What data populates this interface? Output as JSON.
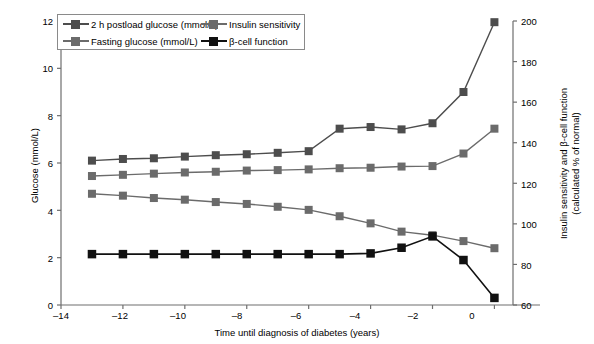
{
  "chart_data": {
    "type": "line",
    "title": "",
    "subtitle": "",
    "xlabel": "Time until diagnosis of diabetes (years)",
    "ylabel": "Glucose (mmol/L)",
    "ylabel_right_line1": "Insulin sensitivity and β-cell function",
    "ylabel_right_line2": "(calculated % of normal)",
    "grid": false,
    "legend_position": "top-left-inside",
    "xlim": [
      -14,
      0.6
    ],
    "xticks": [
      -14,
      -12,
      -10,
      -8,
      -6,
      -4,
      -2,
      0
    ],
    "xticklabels": [
      "–14",
      "–12",
      "–10",
      "–8",
      "–6",
      "–4",
      "–2",
      "0"
    ],
    "ylim": [
      0,
      12
    ],
    "yticks": [
      0,
      2,
      4,
      6,
      8,
      10,
      12
    ],
    "yticklabels": [
      "0",
      "2",
      "4",
      "6",
      "8",
      "10",
      "12"
    ],
    "ylim_right": [
      60,
      200
    ],
    "yticks_right": [
      60,
      80,
      100,
      120,
      140,
      160,
      180,
      200
    ],
    "yticklabels_right": [
      "60",
      "80",
      "100",
      "120",
      "140",
      "160",
      "180",
      "200"
    ],
    "x": [
      -13,
      -12,
      -11,
      -10,
      -9,
      -8,
      -7,
      -6,
      -5,
      -4,
      -3,
      -2,
      -1,
      0
    ],
    "series": [
      {
        "name": "2 h postload glucose (mmol/L)",
        "axis": "left",
        "color": "#4d4d4d",
        "marker": "square",
        "values": [
          6.1,
          6.17,
          6.2,
          6.27,
          6.33,
          6.37,
          6.43,
          6.5,
          7.45,
          7.52,
          7.42,
          7.68,
          9.0,
          11.95
        ]
      },
      {
        "name": "Fasting glucose (mmol/L)",
        "axis": "left",
        "color": "#6b6b6b",
        "marker": "square",
        "values": [
          5.45,
          5.5,
          5.55,
          5.6,
          5.63,
          5.68,
          5.7,
          5.73,
          5.78,
          5.8,
          5.85,
          5.87,
          6.4,
          7.45
        ]
      },
      {
        "name": "Insulin sensitivity",
        "axis": "left",
        "color": "#6b6b6b",
        "marker": "square",
        "values": [
          4.7,
          4.62,
          4.52,
          4.45,
          4.35,
          4.27,
          4.15,
          4.02,
          3.75,
          3.45,
          3.1,
          2.95,
          2.7,
          2.4
        ]
      },
      {
        "name": "β-cell function",
        "axis": "left",
        "color": "#111111",
        "marker": "square",
        "values": [
          2.15,
          2.15,
          2.15,
          2.15,
          2.15,
          2.15,
          2.15,
          2.15,
          2.15,
          2.18,
          2.42,
          2.9,
          1.9,
          0.3
        ]
      }
    ],
    "series_right_equivalents": [
      {
        "name": "Insulin sensitivity",
        "values_percent": [
          115,
          114,
          113,
          112,
          111,
          110,
          109,
          107,
          104,
          100,
          96,
          94,
          91,
          88
        ]
      },
      {
        "name": "β-cell function",
        "values_percent": [
          85,
          85,
          85,
          85,
          85,
          85,
          85,
          85,
          85,
          85,
          88,
          94,
          82,
          62
        ]
      }
    ],
    "annotations": []
  },
  "legend": {
    "entries": [
      {
        "label": "2 h postload glucose (mmol/L)",
        "color": "#4d4d4d"
      },
      {
        "label": "Insulin sensitivity",
        "color": "#6b6b6b"
      },
      {
        "label": "Fasting glucose (mmol/L)",
        "color": "#6b6b6b"
      },
      {
        "label": "β-cell function",
        "color": "#111111"
      }
    ]
  },
  "axes": {
    "left_title": "Glucose (mmol/L)",
    "right_title_line1": "Insulin sensitivity and β-cell function",
    "right_title_line2": "(calculated % of normal)",
    "bottom_title": "Time until diagnosis of diabetes (years)",
    "left_ticks": [
      "12",
      "10",
      "8",
      "6",
      "4",
      "2",
      "0"
    ],
    "right_ticks": [
      "200",
      "180",
      "160",
      "140",
      "120",
      "100",
      "80",
      "60"
    ],
    "bottom_ticks": [
      "–14",
      "–12",
      "–10",
      "–8",
      "–6",
      "–4",
      "–2",
      "0"
    ]
  },
  "colors": {
    "postload": "#4d4d4d",
    "fasting": "#6b6b6b",
    "insulin_sensitivity": "#6b6b6b",
    "beta_cell": "#111111",
    "axis": "#6e6e6e",
    "background": "#ffffff"
  }
}
